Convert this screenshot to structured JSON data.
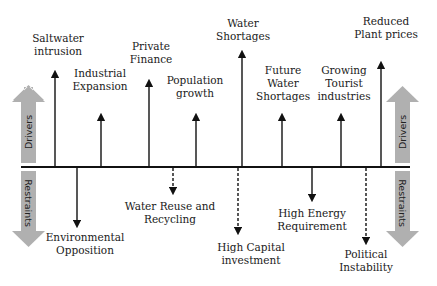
{
  "diagram": {
    "type": "force-field",
    "side_labels": {
      "drivers": "Drivers",
      "restraints": "Restraints"
    },
    "colors": {
      "axis": "#111111",
      "side_arrow": "#b0b0b0",
      "text": "#1a1a1a"
    },
    "drivers": [
      {
        "id": "saltwater",
        "line1": "Saltwater",
        "line2": "intrusion",
        "style": "solid"
      },
      {
        "id": "industrial",
        "line1": "Industrial",
        "line2": "Expansion",
        "style": "solid"
      },
      {
        "id": "private",
        "line1": "Private",
        "line2": "Finance",
        "style": "solid"
      },
      {
        "id": "population",
        "line1": "Population",
        "line2": "growth",
        "style": "solid"
      },
      {
        "id": "water-shortages",
        "line1": "Water",
        "line2": "Shortages",
        "style": "solid"
      },
      {
        "id": "future",
        "line1": "Future",
        "line2": "Water",
        "line3": "Shortages",
        "style": "solid"
      },
      {
        "id": "tourist",
        "line1": "Growing",
        "line2": "Tourist",
        "line3": "industries",
        "style": "solid"
      },
      {
        "id": "plant-prices",
        "line1": "Reduced",
        "line2": "Plant prices",
        "style": "solid"
      }
    ],
    "restraints": [
      {
        "id": "environmental",
        "line1": "Environmental",
        "line2": "Opposition",
        "style": "solid"
      },
      {
        "id": "reuse",
        "line1": "Water Reuse and",
        "line2": "Recycling",
        "style": "dashed"
      },
      {
        "id": "capital",
        "line1": "High Capital",
        "line2": "investment",
        "style": "dashed"
      },
      {
        "id": "energy",
        "line1": "High Energy",
        "line2": "Requirement",
        "style": "solid"
      },
      {
        "id": "political",
        "line1": "Political",
        "line2": "Instability",
        "style": "dashed"
      }
    ]
  }
}
